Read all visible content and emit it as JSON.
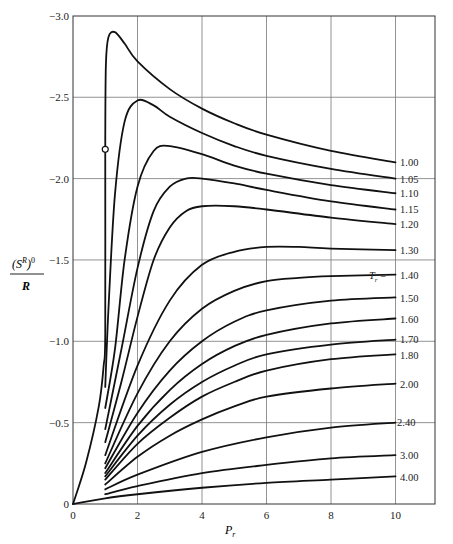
{
  "chart_data": {
    "type": "line",
    "title": "",
    "xlabel": "P_r",
    "ylabel": "(S^R)^0 / R",
    "xlim": [
      0,
      11.2
    ],
    "ylim": [
      0,
      -3.0
    ],
    "x_ticks": [
      "0",
      "2",
      "4",
      "6",
      "8",
      "10"
    ],
    "x_tick_values": [
      0,
      2,
      4,
      6,
      8,
      10
    ],
    "y_ticks": [
      "0",
      "−0.5",
      "−1.0",
      "−1.5",
      "−2.0",
      "−2.5",
      "−3.0"
    ],
    "y_tick_values": [
      0,
      -0.5,
      -1.0,
      -1.5,
      -2.0,
      -2.5,
      -3.0
    ],
    "grid": true,
    "legend_position": "right-edge inline labels",
    "parameter_label": "T_r =",
    "marker": {
      "x": 1.0,
      "y": -2.18,
      "style": "open-circle"
    },
    "series": [
      {
        "name": "1.00",
        "x": [
          0,
          0.4,
          0.8,
          0.95,
          1.0,
          1.0,
          1.02,
          1.1,
          1.3,
          1.6,
          2,
          3,
          4,
          5,
          6,
          8,
          10
        ],
        "y": [
          0,
          -0.25,
          -0.6,
          -0.85,
          -1.05,
          -2.18,
          -2.7,
          -2.87,
          -2.9,
          -2.83,
          -2.72,
          -2.55,
          -2.43,
          -2.34,
          -2.27,
          -2.17,
          -2.1
        ]
      },
      {
        "name": "1.05",
        "x": [
          1.0,
          1.1,
          1.3,
          1.6,
          2,
          2.5,
          3,
          4,
          5,
          6,
          8,
          10
        ],
        "y": [
          -0.72,
          -1.2,
          -1.9,
          -2.35,
          -2.48,
          -2.45,
          -2.38,
          -2.28,
          -2.2,
          -2.14,
          -2.06,
          -2.0
        ]
      },
      {
        "name": "1.10",
        "x": [
          1.0,
          1.3,
          1.6,
          2,
          2.5,
          3,
          4,
          5,
          6,
          8,
          10
        ],
        "y": [
          -0.59,
          -0.95,
          -1.5,
          -1.95,
          -2.17,
          -2.2,
          -2.15,
          -2.08,
          -2.03,
          -1.96,
          -1.91
        ]
      },
      {
        "name": "1.15",
        "x": [
          1.0,
          1.5,
          2,
          2.5,
          3,
          3.5,
          4,
          5,
          6,
          8,
          10
        ],
        "y": [
          -0.46,
          -0.95,
          -1.45,
          -1.8,
          -1.95,
          -2.0,
          -2.0,
          -1.97,
          -1.93,
          -1.86,
          -1.81
        ]
      },
      {
        "name": "1.20",
        "x": [
          1.0,
          1.5,
          2,
          2.5,
          3,
          3.5,
          4,
          5,
          6,
          8,
          10
        ],
        "y": [
          -0.38,
          -0.75,
          -1.15,
          -1.5,
          -1.7,
          -1.8,
          -1.83,
          -1.83,
          -1.81,
          -1.76,
          -1.72
        ]
      },
      {
        "name": "1.30",
        "x": [
          1.0,
          2,
          3,
          4,
          5,
          6,
          7,
          8,
          10
        ],
        "y": [
          -0.3,
          -0.85,
          -1.25,
          -1.47,
          -1.55,
          -1.58,
          -1.58,
          -1.57,
          -1.56
        ]
      },
      {
        "name": "1.40",
        "x": [
          1.0,
          2,
          3,
          4,
          5,
          6,
          7,
          8,
          10
        ],
        "y": [
          -0.25,
          -0.68,
          -1.0,
          -1.2,
          -1.31,
          -1.37,
          -1.39,
          -1.4,
          -1.41
        ]
      },
      {
        "name": "1.50",
        "x": [
          1.0,
          2,
          3,
          4,
          5,
          6,
          8,
          10
        ],
        "y": [
          -0.22,
          -0.56,
          -0.82,
          -1.0,
          -1.12,
          -1.19,
          -1.25,
          -1.27
        ]
      },
      {
        "name": "1.60",
        "x": [
          1.0,
          2,
          3,
          4,
          5,
          6,
          8,
          10
        ],
        "y": [
          -0.19,
          -0.48,
          -0.7,
          -0.86,
          -0.97,
          -1.04,
          -1.11,
          -1.14
        ]
      },
      {
        "name": "1.70",
        "x": [
          1.0,
          2,
          3,
          4,
          5,
          6,
          8,
          10
        ],
        "y": [
          -0.17,
          -0.42,
          -0.61,
          -0.75,
          -0.85,
          -0.92,
          -0.98,
          -1.01
        ]
      },
      {
        "name": "1.80",
        "x": [
          1.0,
          2,
          3,
          4,
          5,
          6,
          8,
          10
        ],
        "y": [
          -0.15,
          -0.37,
          -0.53,
          -0.66,
          -0.75,
          -0.82,
          -0.89,
          -0.92
        ]
      },
      {
        "name": "2.00",
        "x": [
          1.0,
          2,
          3,
          4,
          5,
          6,
          8,
          10
        ],
        "y": [
          -0.12,
          -0.29,
          -0.42,
          -0.52,
          -0.6,
          -0.66,
          -0.71,
          -0.74
        ]
      },
      {
        "name": "2.40",
        "x": [
          1.0,
          2,
          4,
          6,
          8,
          10
        ],
        "y": [
          -0.09,
          -0.18,
          -0.32,
          -0.41,
          -0.47,
          -0.5
        ]
      },
      {
        "name": "3.00",
        "x": [
          1.0,
          2,
          4,
          6,
          8,
          10
        ],
        "y": [
          -0.06,
          -0.11,
          -0.19,
          -0.24,
          -0.28,
          -0.3
        ]
      },
      {
        "name": "4.00",
        "x": [
          0,
          1.0,
          2,
          4,
          6,
          8,
          10
        ],
        "y": [
          0,
          -0.035,
          -0.06,
          -0.1,
          -0.13,
          -0.15,
          -0.17
        ]
      }
    ]
  },
  "labels": {
    "ylabel_num": "(S",
    "ylabel_sup": "R",
    "ylabel_tail": ")",
    "ylabel_zero": "0",
    "ylabel_den": "R",
    "xlabel_main": "P",
    "xlabel_sub": "r",
    "param_label_T": "T",
    "param_label_sub": "r",
    "param_label_eq": " = "
  }
}
